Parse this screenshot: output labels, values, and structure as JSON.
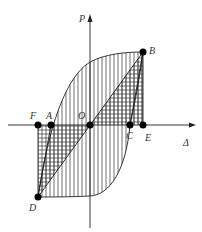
{
  "diagram": {
    "type": "hysteresis-loop",
    "axes": {
      "y_label": "P",
      "x_label": "Δ"
    },
    "points": [
      {
        "id": "B",
        "label": "B"
      },
      {
        "id": "D",
        "label": "D"
      },
      {
        "id": "F",
        "label": "F"
      },
      {
        "id": "A",
        "label": "A"
      },
      {
        "id": "O",
        "label": "O"
      },
      {
        "id": "C",
        "label": "C"
      },
      {
        "id": "E",
        "label": "E"
      }
    ],
    "colors": {
      "stroke": "#222222",
      "point": "#000000",
      "background": "#ffffff"
    }
  }
}
